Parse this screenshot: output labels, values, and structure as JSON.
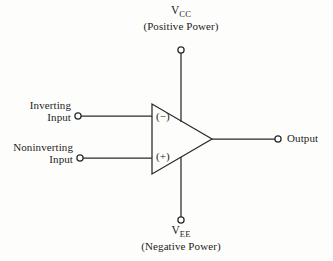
{
  "diagram": {
    "background_color": "#fdfdfc",
    "line_color": "#2a2a2a",
    "text_color": "#1d1d1d",
    "width": 333,
    "height": 261
  },
  "labels": {
    "vcc": {
      "symbol": "V",
      "subscript": "CC",
      "caption": "(Positive Power)"
    },
    "vee": {
      "symbol": "V",
      "subscript": "EE",
      "caption": "(Negative Power)"
    },
    "inverting_input": {
      "line1": "Inverting",
      "line2": "Input"
    },
    "noninverting_input": {
      "line1": "Noninverting",
      "line2": "Input"
    },
    "output": "Output",
    "inverting_terminal_symbol": "(−)",
    "noninverting_terminal_symbol": "(+)"
  },
  "geometry": {
    "triangle": {
      "left_x": 152,
      "top_y": 104,
      "bottom_y": 174,
      "apex_x": 212,
      "apex_y": 139
    },
    "nodes": {
      "vcc_terminal": {
        "x": 181,
        "y": 50
      },
      "vee_terminal": {
        "x": 181,
        "y": 220
      },
      "inverting_terminal": {
        "x": 78,
        "y": 116
      },
      "noninverting_terminal": {
        "x": 80,
        "y": 158
      },
      "output_terminal": {
        "x": 278,
        "y": 139
      }
    }
  }
}
